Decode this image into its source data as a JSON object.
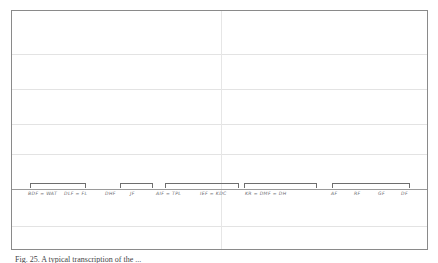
{
  "figure": {
    "frame": {
      "x": 11,
      "y": 10,
      "width": 417,
      "height": 240,
      "border_color": "#8a8a8a",
      "background": "#ffffff"
    },
    "grid": {
      "horizontal_color": "#e3e3e3",
      "vertical_color": "#e6e6e6",
      "horizontal_y": [
        53,
        88,
        123,
        153,
        188,
        225
      ],
      "vertical_x": [
        220
      ],
      "baseline_y": 188,
      "baseline_color": "#9a9a9a"
    },
    "caption": "Fig. 25. A typical transcription of the ..."
  },
  "chart_data": {
    "type": "table",
    "title": "",
    "subtitle": "",
    "xlabel": "",
    "ylabel": "",
    "grid": true,
    "legend": "none",
    "annotations": [
      {
        "text": "BDF = WAT",
        "x": 27,
        "bracket": true
      },
      {
        "text": "DLF = FL",
        "x": 63,
        "bracket": false
      },
      {
        "text": "DHF",
        "x": 104,
        "bracket": true
      },
      {
        "text": "JF",
        "x": 129,
        "bracket": false
      },
      {
        "text": "AIF = TPL",
        "x": 155,
        "bracket": true
      },
      {
        "text": "IEF = KDC",
        "x": 199,
        "bracket": false
      },
      {
        "text": "KR = DMF = DH",
        "x": 244,
        "bracket": false
      },
      {
        "text": "AF",
        "x": 330,
        "bracket": true
      },
      {
        "text": "RF",
        "x": 353,
        "bracket": false
      },
      {
        "text": "GF",
        "x": 377,
        "bracket": false
      },
      {
        "text": "DF",
        "x": 400,
        "bracket": false
      }
    ],
    "brackets": [
      {
        "x": 29,
        "width": 56
      },
      {
        "x": 119,
        "width": 33
      },
      {
        "x": 164,
        "width": 74
      },
      {
        "x": 243,
        "width": 73
      },
      {
        "x": 331,
        "width": 78
      }
    ]
  }
}
